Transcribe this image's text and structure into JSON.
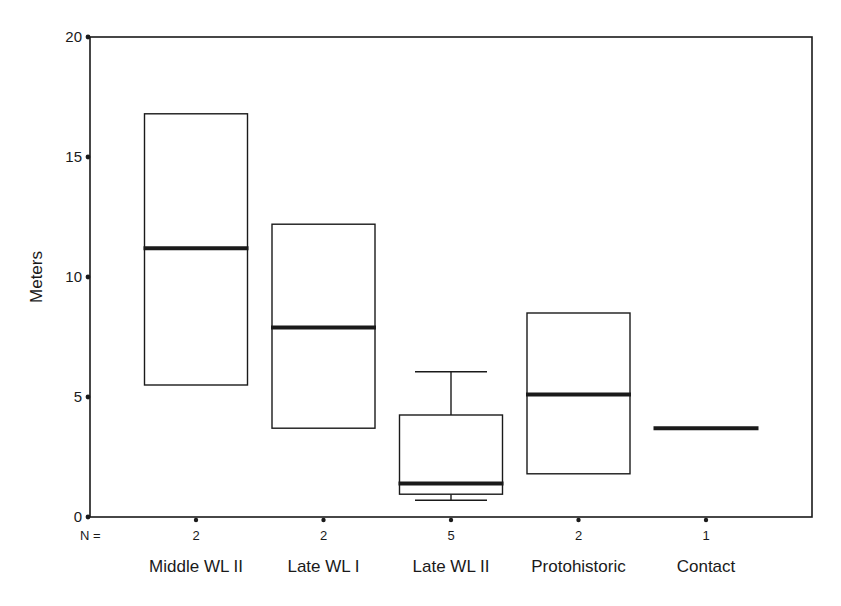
{
  "chart_data": {
    "type": "boxplot",
    "title": "",
    "xlabel": "",
    "ylabel": "Meters",
    "ylim": [
      0,
      20
    ],
    "yticks": [
      0,
      5,
      10,
      15,
      20
    ],
    "grid": false,
    "legend": null,
    "n_prefix": "N =",
    "categories": [
      "Middle WL II",
      "Late WL I",
      "Late WL II",
      "Protohistoric",
      "Contact"
    ],
    "n": [
      2,
      2,
      5,
      2,
      1
    ],
    "boxes": [
      {
        "category": "Middle WL II",
        "n": 2,
        "whisker_low": null,
        "q1": 5.5,
        "median": 11.2,
        "q3": 16.8,
        "whisker_high": null
      },
      {
        "category": "Late WL I",
        "n": 2,
        "whisker_low": null,
        "q1": 3.7,
        "median": 7.9,
        "q3": 12.2,
        "whisker_high": null
      },
      {
        "category": "Late WL II",
        "n": 5,
        "whisker_low": 0.7,
        "q1": 0.95,
        "median": 1.4,
        "q3": 4.25,
        "whisker_high": 6.05
      },
      {
        "category": "Protohistoric",
        "n": 2,
        "whisker_low": null,
        "q1": 1.8,
        "median": 5.1,
        "q3": 8.5,
        "whisker_high": null
      },
      {
        "category": "Contact",
        "n": 1,
        "whisker_low": null,
        "q1": 3.7,
        "median": 3.7,
        "q3": 3.7,
        "whisker_high": null
      }
    ]
  },
  "style": {
    "line_color": "#1a1a1a",
    "box_fill": "#ffffff",
    "median_color": "#1a1a1a"
  }
}
